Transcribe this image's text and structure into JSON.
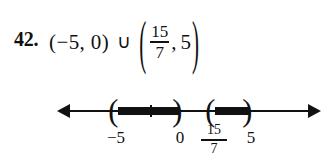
{
  "problem": {
    "number_label": "42.",
    "interval_one": "(−5, 0)",
    "union_symbol": "∪",
    "paren_open": "(",
    "paren_close": ")",
    "fraction_numerator": "15",
    "fraction_denominator": "7",
    "comma": ",",
    "upper_bound": "5"
  },
  "number_line": {
    "arrow_left": "left-arrow-icon",
    "arrow_right": "right-arrow-icon",
    "labels": [
      {
        "text": "−5",
        "value": -5,
        "x": 116
      },
      {
        "text": "0",
        "value": 0,
        "x": 180
      },
      {
        "text": "5",
        "value": 5,
        "x": 250
      }
    ],
    "fraction_label": {
      "numerator": "15",
      "denominator": "7",
      "value": 2.142857,
      "x": 213
    },
    "intervals": [
      {
        "name": "interval-neg5-to-0",
        "left_bracket": "(",
        "right_bracket": ")",
        "left_value": -5,
        "right_value": 0,
        "open_left": true,
        "open_right": true
      },
      {
        "name": "interval-fifteen-sevenths-to-5",
        "left_bracket": "(",
        "right_bracket": ")",
        "left_value": 2.142857,
        "right_value": 5,
        "open_left": true,
        "open_right": true
      }
    ],
    "unlabeled_ticks": [
      {
        "x": 150
      }
    ],
    "line_color": "#111111"
  }
}
